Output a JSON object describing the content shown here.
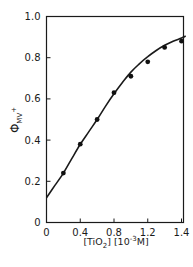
{
  "chart_data": {
    "type": "scatter",
    "title": "",
    "xlabel": "[TiO2] [10^-3 M]",
    "ylabel": "Φ MV+",
    "xlabel_parts": {
      "open": "[TiO",
      "sub": "2",
      "mid": "] [10",
      "sup": "-3",
      "close": "M]"
    },
    "ylabel_parts": {
      "main": "Φ",
      "sub": "MV",
      "sup": "+"
    },
    "xlim": [
      0,
      1.6
    ],
    "ylim": [
      0,
      1.0
    ],
    "x_ticks": [
      {
        "value": 0,
        "label": "0"
      },
      {
        "value": 0.4,
        "label": "0.4"
      },
      {
        "value": 0.8,
        "label": "0.8"
      },
      {
        "value": 1.2,
        "label": "1.2"
      },
      {
        "value": 1.6,
        "label": "1.4"
      }
    ],
    "y_ticks": [
      {
        "value": 0,
        "label": "0"
      },
      {
        "value": 0.2,
        "label": "0.2"
      },
      {
        "value": 0.4,
        "label": "0.4"
      },
      {
        "value": 0.6,
        "label": "0.6"
      },
      {
        "value": 0.8,
        "label": "0.8"
      },
      {
        "value": 1.0,
        "label": "1.0"
      }
    ],
    "grid": false,
    "legend": null,
    "series": [
      {
        "name": "measured",
        "style": "markers",
        "x": [
          0.2,
          0.4,
          0.6,
          0.8,
          1.0,
          1.2,
          1.4,
          1.6
        ],
        "y": [
          0.24,
          0.38,
          0.5,
          0.63,
          0.71,
          0.78,
          0.85,
          0.88
        ]
      },
      {
        "name": "fit",
        "style": "line",
        "x": [
          0,
          0.1,
          0.2,
          0.3,
          0.4,
          0.5,
          0.6,
          0.7,
          0.8,
          0.9,
          1.0,
          1.1,
          1.2,
          1.3,
          1.4,
          1.5,
          1.6,
          1.65
        ],
        "y": [
          0.12,
          0.18,
          0.24,
          0.31,
          0.38,
          0.44,
          0.5,
          0.565,
          0.625,
          0.68,
          0.73,
          0.77,
          0.805,
          0.835,
          0.86,
          0.88,
          0.895,
          0.905
        ]
      }
    ]
  }
}
